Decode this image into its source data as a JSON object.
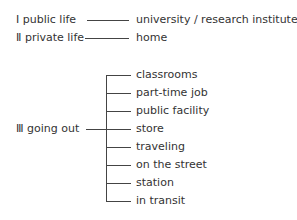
{
  "categories": [
    {
      "numeral": "Ⅰ",
      "label": "public life",
      "places": [
        "university / research institute"
      ]
    },
    {
      "numeral": "Ⅱ",
      "label": "private life",
      "places": [
        "home"
      ]
    },
    {
      "numeral": "Ⅲ",
      "label": "going out",
      "places": [
        "classrooms",
        "part-time job",
        "public facility",
        "store",
        "traveling",
        "on the street",
        "station",
        "in transit"
      ]
    }
  ]
}
